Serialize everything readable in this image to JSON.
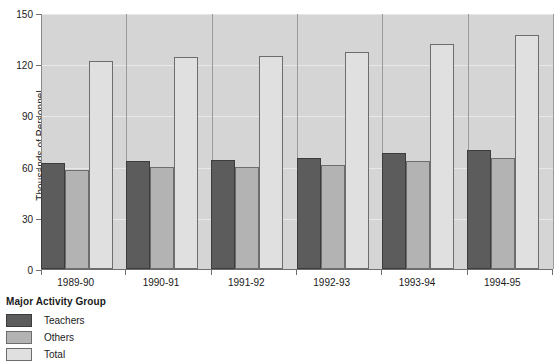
{
  "chart_data": {
    "type": "bar",
    "title": "",
    "xlabel": "",
    "ylabel": "Thousands of Personnel",
    "categories": [
      "1989-90",
      "1990-91",
      "1991-92",
      "1992-93",
      "1993-94",
      "1994-95"
    ],
    "series": [
      {
        "name": "Teachers",
        "color": "#5c5c5c",
        "values": [
          62,
          63,
          64,
          65,
          68,
          70
        ]
      },
      {
        "name": "Others",
        "color": "#b3b3b3",
        "values": [
          58,
          60,
          60,
          61,
          63,
          65
        ]
      },
      {
        "name": "Total",
        "color": "#e0e0e0",
        "values": [
          122,
          124,
          125,
          127,
          132,
          137
        ]
      }
    ],
    "ylim": [
      0,
      150
    ],
    "yticks": [
      0,
      30,
      60,
      90,
      120,
      150
    ],
    "ytick_labels": [
      "0",
      "30",
      "60",
      "90",
      "120",
      "150"
    ],
    "grid": true,
    "legend_position": "below-left",
    "plot_background": "#d5d5d5"
  },
  "legend": {
    "title": "Major Activity Group",
    "entries": [
      {
        "label": "Teachers"
      },
      {
        "label": "Others"
      },
      {
        "label": "Total"
      }
    ]
  }
}
